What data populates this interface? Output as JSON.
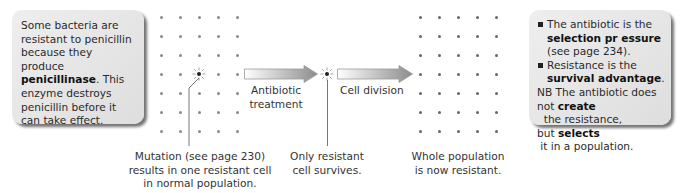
{
  "left_box": {
    "line1": "Some bacteria are",
    "line2": "resistant to penicillin",
    "line3": "because they produce",
    "bold_term": "penicillinase",
    "line4_rest": ". This",
    "line5": "enzyme destroys",
    "line6": "penicillin before it",
    "line7": "can take effect."
  },
  "arrows": {
    "first_label_1": "Antibiotic",
    "first_label_2": "treatment",
    "second_label": "Cell division"
  },
  "captions": {
    "mutation_1": "Mutation (see page 230)",
    "mutation_2": "results in one resistant cell",
    "mutation_3": "in normal population.",
    "survivor_1": "Only resistant",
    "survivor_2": "cell survives.",
    "whole_1": "Whole population",
    "whole_2": "is now resistant."
  },
  "right_box": {
    "b1_line1": "The antibiotic is the",
    "b1_bold": "selection pr essure",
    "b1_line3": "(see page 234).",
    "b2_line1": "Resistance is the",
    "b2_bold": "survival advantage",
    "b2_end": ".",
    "nb_line1": "NB The antibiotic does",
    "nb_not": "not ",
    "nb_create": "create",
    "nb_rest": "  the resistance,",
    "nb_but": "but ",
    "nb_selects": "selects",
    "nb_end": " it in a population."
  },
  "grid": {
    "cols": 5,
    "rows": 7,
    "spacing": 19,
    "dot_color": "#8a8a8a",
    "resistant_cell_color": "#222222"
  }
}
